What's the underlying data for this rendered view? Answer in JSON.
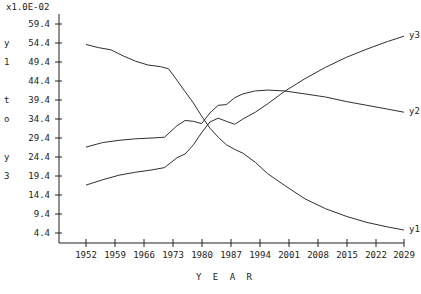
{
  "chart_data": {
    "type": "line",
    "title": "",
    "xlabel": "Y E A R",
    "ylabel": "y1 to y3",
    "y_axis_multiplier": "x1.0E-02",
    "grid": false,
    "legend_position": "right-inline",
    "xlim": [
      1952,
      2029
    ],
    "ylim": [
      4.4,
      59.4
    ],
    "x_ticks": [
      "1952",
      "1959",
      "1966",
      "1973",
      "1980",
      "1987",
      "1994",
      "2001",
      "2008",
      "2015",
      "2022",
      "2029"
    ],
    "y_ticks": [
      "4.4",
      "9.4",
      "14.4",
      "19.4",
      "24.4",
      "29.4",
      "34.4",
      "39.4",
      "44.4",
      "49.4",
      "54.4",
      "59.4"
    ],
    "series": [
      {
        "name": "y1",
        "label": "y1",
        "color": "#303030",
        "x": [
          1952,
          1955,
          1958,
          1961,
          1964,
          1967,
          1970,
          1972,
          1974,
          1976,
          1978,
          1980,
          1982,
          1984,
          1986,
          1988,
          1990,
          1993,
          1996,
          2000,
          2005,
          2010,
          2015,
          2020,
          2025,
          2029
        ],
        "values": [
          54.0,
          53.2,
          52.6,
          51.0,
          49.6,
          48.6,
          48.2,
          47.6,
          44.6,
          41.6,
          38.6,
          35.2,
          32.0,
          29.6,
          27.6,
          26.4,
          25.4,
          23.0,
          20.0,
          17.0,
          13.4,
          10.8,
          8.8,
          7.2,
          6.0,
          5.2
        ]
      },
      {
        "name": "y2",
        "label": "y2",
        "color": "#303030",
        "x": [
          1952,
          1956,
          1960,
          1964,
          1968,
          1971,
          1974,
          1976,
          1978,
          1980,
          1982,
          1984,
          1986,
          1988,
          1990,
          1993,
          1996,
          2000,
          2005,
          2010,
          2015,
          2020,
          2025,
          2029
        ],
        "values": [
          27.0,
          28.2,
          28.8,
          29.2,
          29.4,
          29.6,
          32.6,
          34.0,
          33.8,
          33.2,
          36.0,
          38.0,
          38.2,
          40.0,
          41.0,
          41.8,
          42.0,
          41.8,
          41.0,
          40.2,
          39.0,
          38.0,
          37.0,
          36.2
        ]
      },
      {
        "name": "y3",
        "label": "y3",
        "color": "#303030",
        "x": [
          1952,
          1956,
          1960,
          1964,
          1968,
          1971,
          1974,
          1976,
          1978,
          1980,
          1982,
          1984,
          1986,
          1988,
          1990,
          1993,
          1996,
          2000,
          2005,
          2010,
          2015,
          2020,
          2025,
          2029
        ],
        "values": [
          17.0,
          18.4,
          19.6,
          20.4,
          21.0,
          21.6,
          24.2,
          25.2,
          27.6,
          30.8,
          33.6,
          34.6,
          33.8,
          33.0,
          34.4,
          36.2,
          38.4,
          41.6,
          45.0,
          48.0,
          50.6,
          52.8,
          54.8,
          56.2
        ]
      }
    ]
  },
  "axis": {
    "exponent_label": "x1.0E-02",
    "y_title_chars": [
      "y",
      "1",
      "",
      "t",
      "o",
      "",
      "y",
      "3"
    ],
    "x_title": "Y E A R"
  }
}
